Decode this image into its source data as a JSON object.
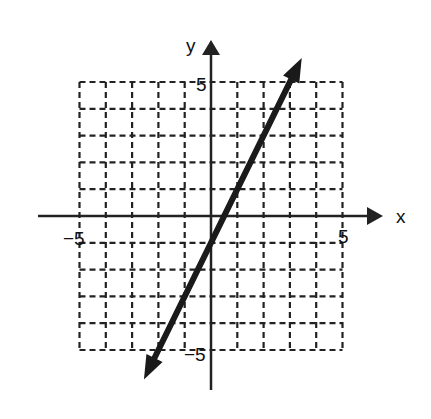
{
  "chart_data": {
    "type": "line",
    "title": "",
    "xlabel": "x",
    "ylabel": "y",
    "xlim": [
      -5,
      5
    ],
    "ylim": [
      -5,
      5
    ],
    "grid": true,
    "grid_style": "dashed",
    "tick_labels": {
      "x": [
        "-5",
        "5"
      ],
      "y": [
        "5",
        "-5"
      ]
    },
    "series": [
      {
        "name": "line",
        "equation": "y = 2x - 1",
        "slope": 2,
        "intercept": -1,
        "x": [
          -2,
          0,
          1,
          2
        ],
        "y": [
          -5,
          -1,
          1,
          3
        ],
        "arrows": "both"
      }
    ],
    "color": "#1a1a1a"
  },
  "axes": {
    "x_label": "x",
    "y_label": "y",
    "x_min_label": "−5",
    "x_max_label": "5",
    "y_max_label": "5",
    "y_min_label": "−5"
  }
}
